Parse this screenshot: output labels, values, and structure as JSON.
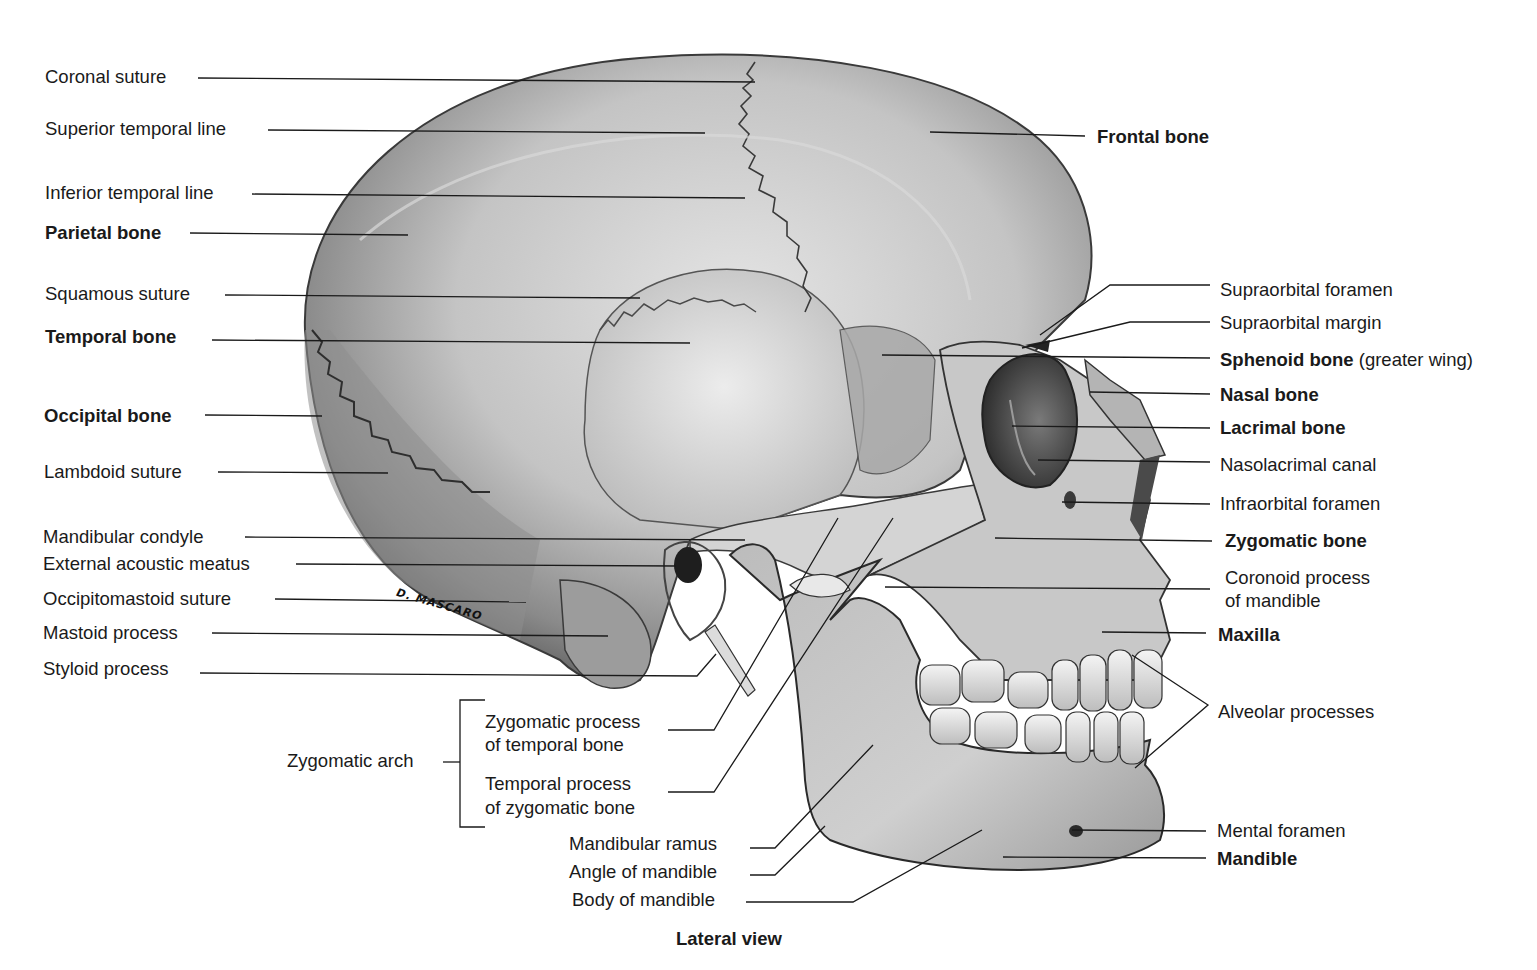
{
  "figure": {
    "caption": "Lateral view",
    "signature": "D. MASCARO",
    "background": "#ffffff",
    "ink_color": "#1a1a1a"
  },
  "labels_left": [
    {
      "id": "coronal-suture",
      "text": "Coronal suture",
      "bold": false
    },
    {
      "id": "superior-temporal-line",
      "text": "Superior temporal line",
      "bold": false
    },
    {
      "id": "inferior-temporal-line",
      "text": "Inferior temporal line",
      "bold": false
    },
    {
      "id": "parietal-bone",
      "text": "Parietal bone",
      "bold": true
    },
    {
      "id": "squamous-suture",
      "text": "Squamous suture",
      "bold": false
    },
    {
      "id": "temporal-bone",
      "text": "Temporal bone",
      "bold": true
    },
    {
      "id": "occipital-bone",
      "text": "Occipital bone",
      "bold": true
    },
    {
      "id": "lambdoid-suture",
      "text": "Lambdoid suture",
      "bold": false
    },
    {
      "id": "mandibular-condyle",
      "text": "Mandibular condyle",
      "bold": false
    },
    {
      "id": "external-acoustic-meatus",
      "text": "External acoustic meatus",
      "bold": false
    },
    {
      "id": "occipitomastoid-suture",
      "text": "Occipitomastoid suture",
      "bold": false
    },
    {
      "id": "mastoid-process",
      "text": "Mastoid process",
      "bold": false
    },
    {
      "id": "styloid-process",
      "text": "Styloid process",
      "bold": false
    }
  ],
  "labels_right": [
    {
      "id": "frontal-bone",
      "text": "Frontal bone",
      "bold": true
    },
    {
      "id": "supraorbital-foramen",
      "text": "Supraorbital foramen",
      "bold": false
    },
    {
      "id": "supraorbital-margin",
      "text": "Supraorbital margin",
      "bold": false
    },
    {
      "id": "sphenoid-bone",
      "text": "Sphenoid bone",
      "suffix": "(greater wing)",
      "bold": true
    },
    {
      "id": "nasal-bone",
      "text": "Nasal bone",
      "bold": true
    },
    {
      "id": "lacrimal-bone",
      "text": "Lacrimal bone",
      "bold": true
    },
    {
      "id": "nasolacrimal-canal",
      "text": "Nasolacrimal canal",
      "bold": false
    },
    {
      "id": "infraorbital-foramen",
      "text": "Infraorbital foramen",
      "bold": false
    },
    {
      "id": "zygomatic-bone",
      "text": "Zygomatic bone",
      "bold": true
    },
    {
      "id": "coronoid-process",
      "text": "Coronoid process",
      "text2": "of mandible",
      "bold": false
    },
    {
      "id": "maxilla",
      "text": "Maxilla",
      "bold": true
    },
    {
      "id": "alveolar-processes",
      "text": "Alveolar processes",
      "bold": false
    },
    {
      "id": "mental-foramen",
      "text": "Mental foramen",
      "bold": false
    },
    {
      "id": "mandible",
      "text": "Mandible",
      "bold": true
    }
  ],
  "labels_bottom": {
    "zygomatic_arch": "Zygomatic arch",
    "zygomatic_process": {
      "line1": "Zygomatic process",
      "line2": "of temporal bone"
    },
    "temporal_process": {
      "line1": "Temporal process",
      "line2": "of zygomatic bone"
    },
    "mandibular_ramus": "Mandibular ramus",
    "angle_of_mandible": "Angle of mandible",
    "body_of_mandible": "Body of mandible"
  }
}
